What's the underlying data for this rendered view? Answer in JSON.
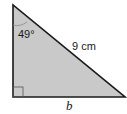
{
  "figure": {
    "type": "right-triangle",
    "fill_color": "#c9c9c9",
    "stroke_color": "#1a1a1a",
    "angle_label": "49°",
    "hypotenuse_label": "9 cm",
    "base_label": "b",
    "right_angle_marker": true
  }
}
